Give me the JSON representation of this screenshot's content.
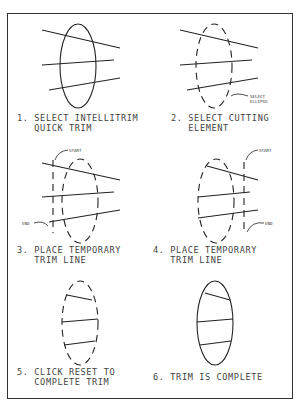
{
  "steps": [
    {
      "number": "1.",
      "line1": "SELECT INTELLITRIM",
      "line2": "QUICK TRIM"
    },
    {
      "number": "2.",
      "line1": "SELECT CUTTING",
      "line2": "ELEMENT",
      "callout": [
        "SELECT",
        "ELLIPSE"
      ]
    },
    {
      "number": "3.",
      "line1": "PLACE TEMPORARY",
      "line2": "TRIM LINE",
      "callout_start": "START",
      "callout_end": "END"
    },
    {
      "number": "4.",
      "line1": "PLACE TEMPORARY",
      "line2": "TRIM LINE",
      "callout_start": "START",
      "callout_end": "END"
    },
    {
      "number": "5.",
      "line1": "CLICK RESET TO",
      "line2": "COMPLETE TRIM"
    },
    {
      "number": "6.",
      "line1": "TRIM IS COMPLETE",
      "line2": ""
    }
  ]
}
